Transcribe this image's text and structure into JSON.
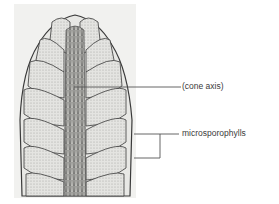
{
  "figure": {
    "labels": [
      {
        "id": "cone-axis",
        "text": "(cone axis)"
      },
      {
        "id": "microsporophylls",
        "text": "microsporophylls"
      }
    ],
    "colors": {
      "background": "#ffffff",
      "panel": "#f1f1ef",
      "leader_line": "#555555",
      "ink": "#3a3a3a",
      "tissue": "#d9d9d6"
    }
  }
}
